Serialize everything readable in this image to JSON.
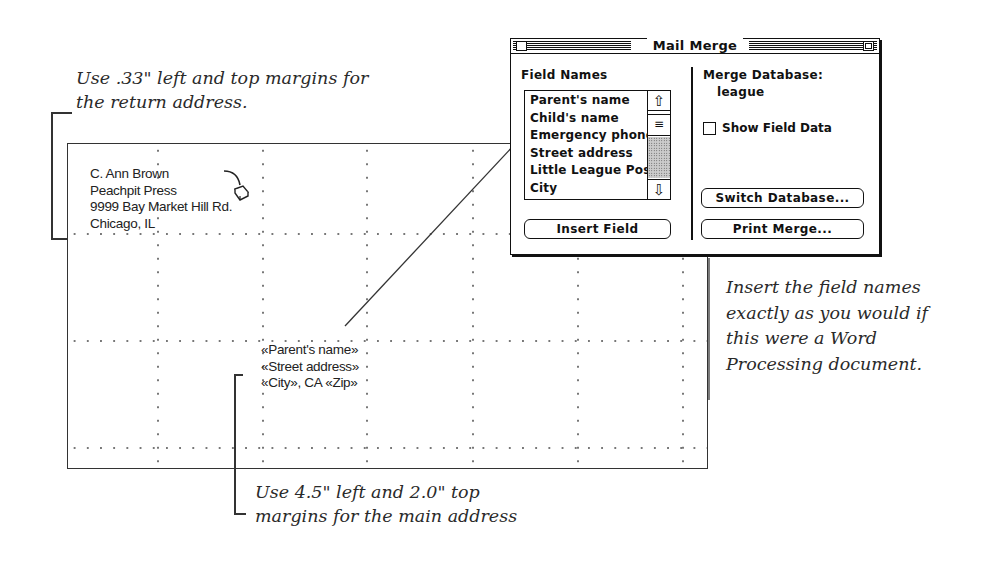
{
  "annotations": {
    "top_note": [
      "Use .33\" left and top margins for",
      "the return address."
    ],
    "right_note": [
      "Insert the field names",
      "exactly as you would if",
      "this were a Word",
      "Processing document."
    ],
    "bottom_note": [
      "Use 4.5\" left and 2.0\" top",
      "margins for the main address"
    ]
  },
  "document": {
    "return_address": [
      "C. Ann Brown",
      "Peachpit Press",
      "9999  Bay Market Hill Rd.",
      "Chicago, IL"
    ],
    "main_address": [
      "«Parent's name»",
      "«Street address»",
      "«City»,  CA «Zip»"
    ]
  },
  "mail_merge": {
    "title": "Mail Merge",
    "field_names_label": "Field Names",
    "field_names": [
      "Parent's name",
      "Child's name",
      "Emergency phone",
      "Street address",
      "Little League Position",
      "City"
    ],
    "merge_database_label": "Merge Database:",
    "merge_database_value": "league",
    "show_field_data_label": "Show Field Data",
    "show_field_data_checked": false,
    "buttons": {
      "insert_field": "Insert Field",
      "switch_database": "Switch Database...",
      "print_merge": "Print Merge..."
    },
    "scroll_up_glyph": "⇧",
    "scroll_down_glyph": "⇩",
    "scroll_thumb_glyph": "≡"
  },
  "icons": {
    "mouse": "mouse-icon"
  }
}
